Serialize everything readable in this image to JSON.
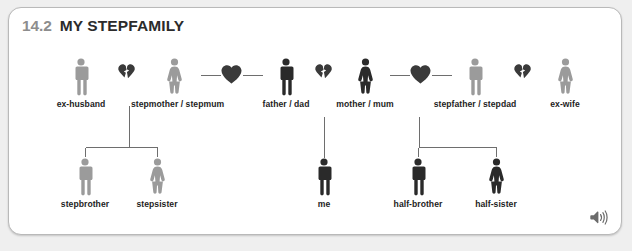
{
  "header": {
    "unit_number": "14.2",
    "title": "MY STEPFAMILY"
  },
  "audio": {
    "icon": "speaker-icon"
  },
  "diagram": {
    "generation_1": [
      {
        "key": "ex_husband",
        "label": "ex-husband",
        "gender": "male",
        "tone": "light",
        "x": 72
      },
      {
        "key": "broken_1",
        "label": "broken-heart",
        "type": "broken-heart",
        "x": 117
      },
      {
        "key": "stepmother",
        "label": "stepmother / stepmum",
        "gender": "female",
        "tone": "light",
        "x": 165
      },
      {
        "key": "whole_1",
        "label": "heart",
        "type": "whole-heart",
        "x": 222
      },
      {
        "key": "father",
        "label": "father / dad",
        "gender": "male",
        "tone": "dark",
        "x": 277
      },
      {
        "key": "broken_2",
        "label": "broken-heart",
        "type": "broken-heart",
        "x": 314
      },
      {
        "key": "mother",
        "label": "mother / mum",
        "gender": "female",
        "tone": "dark",
        "x": 356
      },
      {
        "key": "whole_2",
        "label": "heart",
        "type": "whole-heart",
        "x": 411
      },
      {
        "key": "stepfather",
        "label": "stepfather / stepdad",
        "gender": "male",
        "tone": "light",
        "x": 466
      },
      {
        "key": "broken_3",
        "label": "broken-heart",
        "type": "broken-heart",
        "x": 513
      },
      {
        "key": "ex_wife",
        "label": "ex-wife",
        "gender": "female",
        "tone": "light",
        "x": 556
      }
    ],
    "generation_2": [
      {
        "key": "stepbrother",
        "label": "stepbrother",
        "gender": "male",
        "tone": "light",
        "x": 76
      },
      {
        "key": "stepsister",
        "label": "stepsister",
        "gender": "female",
        "tone": "light",
        "x": 148
      },
      {
        "key": "me",
        "label": "me",
        "gender": "male",
        "tone": "dark",
        "x": 315
      },
      {
        "key": "half_brother",
        "label": "half-brother",
        "gender": "male",
        "tone": "dark",
        "x": 409
      },
      {
        "key": "half_sister",
        "label": "half-sister",
        "gender": "female",
        "tone": "dark",
        "x": 487
      }
    ],
    "relationships": [
      {
        "from": "ex-husband + stepmother",
        "to": [
          "stepbrother",
          "stepsister"
        ]
      },
      {
        "from": "father + mother",
        "to": [
          "me"
        ]
      },
      {
        "from": "mother + stepfather",
        "to": [
          "half-brother",
          "half-sister"
        ]
      }
    ]
  },
  "colors": {
    "figure_light": "#9b9b9b",
    "figure_dark": "#2a2a2a",
    "heart_dark": "#3a3a3a",
    "line": "#6e6e6e",
    "card_border": "#b9b9b9",
    "page_background": "#efefef",
    "unit_number": "#8d8d8d",
    "title": "#2b2b2b"
  }
}
